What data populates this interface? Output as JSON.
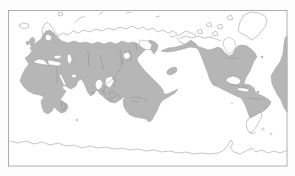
{
  "figure": {
    "kind": "world-distribution-range-map",
    "projection": "rectangular, pacific-centered",
    "colors": {
      "page_bg": "#fdfdfd",
      "ocean": "#ffffff",
      "frame": "#9b9b9b",
      "coastline": "#8c8c8c",
      "detail": "#808080",
      "range_fill": "#b6b6b6",
      "range_outline": "#a0a0a0"
    },
    "shaded_regions": [
      "europe-and-eurasia-south-of-taiga",
      "africa-with-madagascar",
      "arabia-india-southeast-asia",
      "indonesia-melanesia-west-pacific",
      "australia",
      "hawaiian-islands-blob",
      "north-america-south-of-arctic-with-aleutian-band",
      "central-america-and-caribbean",
      "south-america-north-of-patagonia",
      "west-africa-repeat-at-right-map-edge",
      "scattered-atlantic-and-indian-ocean-island-dots"
    ],
    "unshaded_outline_regions": [
      "arctic-siberian-coast",
      "northern-scandinavia",
      "iceland",
      "svalbard-and-arctic-islands",
      "greenland",
      "canadian-arctic-archipelago",
      "alaska-interior-and-north",
      "hudson-bay",
      "patagonia-and-tierra-del-fuego",
      "falkland-and-subantarctic-islands",
      "antarctica-coastline"
    ]
  }
}
